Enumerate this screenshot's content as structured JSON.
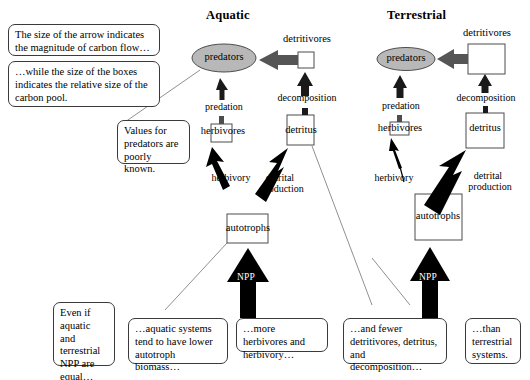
{
  "figure": {
    "columns": [
      {
        "id": "aquatic",
        "title": "Aquatic"
      },
      {
        "id": "terrestrial",
        "title": "Terrestrial"
      }
    ],
    "colors": {
      "predator_fill": "#b8b8b8",
      "box_fill": "#ffffff",
      "stroke": "#4d4d4d",
      "arrow_dark": "#000000",
      "arrow_gray": "#555555",
      "callout_border": "#3a3a3a",
      "connector": "#8a8a8a"
    }
  },
  "callouts": [
    {
      "id": "arrow-size-note",
      "text": "The size of the arrow indicates the magnitude of carbon flow…"
    },
    {
      "id": "box-size-note",
      "text": "…while the size of the boxes indicates the relative size of the carbon pool."
    },
    {
      "id": "predator-values-note",
      "text": "Values for predators are poorly known."
    },
    {
      "id": "npp-equal-note",
      "text": "Even if aquatic and terrestrial NPP are equal…"
    },
    {
      "id": "autotroph-biomass-note",
      "text": "…aquatic systems tend to have lower autotroph biomass…"
    },
    {
      "id": "more-herbivores-note",
      "text": "…more herbivores and herbivory…"
    },
    {
      "id": "fewer-detritivores-note",
      "text": "…and fewer detritivores,  detritus, and decomposition…"
    },
    {
      "id": "than-terrestrial-note",
      "text": "…than terrestrial systems."
    }
  ],
  "aquatic": {
    "nodes": {
      "predators": "predators",
      "detritivores": "detritivores",
      "herbivores": "herbivores",
      "detritus": "detritus",
      "autotrophs": "autotrophs"
    },
    "flows": {
      "predation": "predation",
      "decomposition": "decomposition",
      "herbivory": "herbivory",
      "detrital_production_line1": "detrital",
      "detrital_production_line2": "production",
      "npp": "NPP"
    }
  },
  "terrestrial": {
    "nodes": {
      "predators": "predators",
      "detritivores": "detritivores",
      "herbivores": "herbivores",
      "detritus": "detritus",
      "autotrophs": "autotrophs"
    },
    "flows": {
      "predation": "predation",
      "decomposition": "decomposition",
      "herbivory": "herbivory",
      "detrital_production_line1": "detrital",
      "detrital_production_line2": "production",
      "npp": "NPP"
    }
  }
}
